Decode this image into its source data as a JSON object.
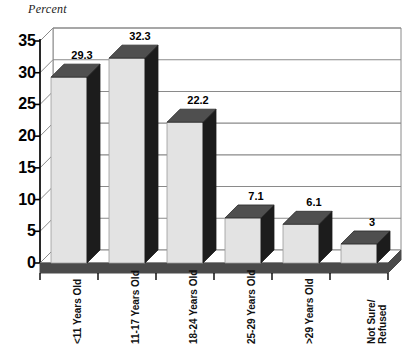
{
  "chart_data": {
    "type": "bar",
    "title": "",
    "axis_note": "Percent",
    "ylabel": "Percent",
    "xlabel": "",
    "categories": [
      "<11 Years Old",
      "11-17 Years Old",
      "18-24 Years Old",
      "25-29 Years Old",
      ">29 Years Old",
      "Not Sure/\nRefused"
    ],
    "values": [
      29.3,
      32.3,
      22.2,
      7.1,
      6.1,
      3
    ],
    "value_labels": [
      "29.3",
      "32.3",
      "22.2",
      "7.1",
      "6.1",
      "3"
    ],
    "ylim": [
      0,
      35
    ],
    "yticks": [
      0,
      5,
      10,
      15,
      20,
      25,
      30,
      35
    ],
    "ytick_labels": [
      "0",
      "5",
      "10",
      "15",
      "20",
      "25",
      "30",
      "35"
    ],
    "grid": true,
    "legend": false,
    "style": "3d-column",
    "colors": {
      "bar_front": "#e3e3e3",
      "bar_side": "#1c1c1c",
      "bar_top": "#4f4f4f",
      "floor_front": "#4a4a4a",
      "floor_top": "#ffffff",
      "gridline": "#8a8a8a",
      "axis": "#000000",
      "text": "#000000",
      "background": "#ffffff"
    }
  }
}
